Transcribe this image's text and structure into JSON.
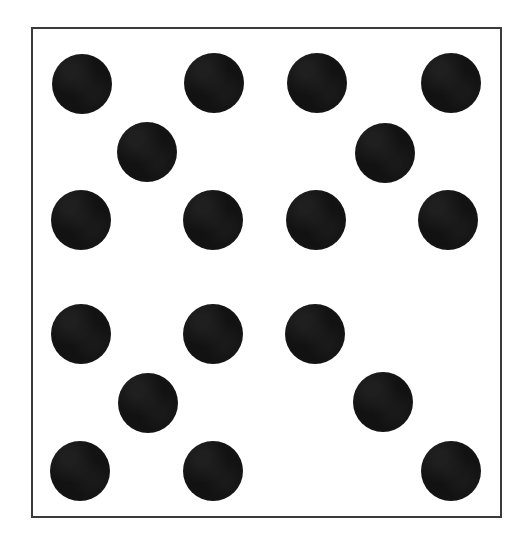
{
  "figure": {
    "title": "Scattered Dot Pattern",
    "canvas": {
      "width": 523,
      "height": 556,
      "background": "#ffffff"
    },
    "frame": {
      "name": "rectangular-border",
      "x": 31,
      "y": 27,
      "width": 471,
      "height": 491,
      "stroke_color": "#3a3a3a",
      "stroke_width": 2,
      "fill_color": "#ffffff"
    },
    "dot_style": {
      "fill_color": "#121212",
      "shape": "circle",
      "default_radius": 30
    }
  },
  "chart_data": {
    "type": "scatter",
    "title": "Scattered Dot Pattern",
    "xlabel": "",
    "ylabel": "",
    "grid": false,
    "legend": null,
    "xlim": [
      31,
      502
    ],
    "ylim": [
      27,
      518
    ],
    "marker": "filled-circle",
    "marker_color": "#121212",
    "count": 19,
    "rows": [
      {
        "row": 1,
        "y": 84,
        "count": 4
      },
      {
        "row": 2,
        "y": 152,
        "count": 2
      },
      {
        "row": 3,
        "y": 220,
        "count": 4
      },
      {
        "row": 4,
        "y": 334,
        "count": 3
      },
      {
        "row": 5,
        "y": 403,
        "count": 2
      },
      {
        "row": 6,
        "y": 471,
        "count": 3
      }
    ],
    "points": [
      {
        "id": "dot-1",
        "row": 1,
        "col": 1,
        "cx": 82,
        "cy": 84,
        "r": 30
      },
      {
        "id": "dot-2",
        "row": 1,
        "col": 2,
        "cx": 214,
        "cy": 83,
        "r": 30
      },
      {
        "id": "dot-3",
        "row": 1,
        "col": 3,
        "cx": 317,
        "cy": 83,
        "r": 30
      },
      {
        "id": "dot-4",
        "row": 1,
        "col": 4,
        "cx": 451,
        "cy": 83,
        "r": 30
      },
      {
        "id": "dot-5",
        "row": 2,
        "col": 1,
        "cx": 147,
        "cy": 152,
        "r": 30
      },
      {
        "id": "dot-6",
        "row": 2,
        "col": 2,
        "cx": 385,
        "cy": 153,
        "r": 30
      },
      {
        "id": "dot-7",
        "row": 3,
        "col": 1,
        "cx": 81,
        "cy": 220,
        "r": 30
      },
      {
        "id": "dot-8",
        "row": 3,
        "col": 2,
        "cx": 213,
        "cy": 220,
        "r": 30
      },
      {
        "id": "dot-9",
        "row": 3,
        "col": 3,
        "cx": 316,
        "cy": 220,
        "r": 30
      },
      {
        "id": "dot-10",
        "row": 3,
        "col": 4,
        "cx": 448,
        "cy": 220,
        "r": 30
      },
      {
        "id": "dot-11",
        "row": 4,
        "col": 1,
        "cx": 81,
        "cy": 334,
        "r": 30
      },
      {
        "id": "dot-12",
        "row": 4,
        "col": 2,
        "cx": 213,
        "cy": 334,
        "r": 30
      },
      {
        "id": "dot-13",
        "row": 4,
        "col": 3,
        "cx": 315,
        "cy": 334,
        "r": 30
      },
      {
        "id": "dot-14",
        "row": 5,
        "col": 1,
        "cx": 148,
        "cy": 403,
        "r": 30
      },
      {
        "id": "dot-15",
        "row": 5,
        "col": 2,
        "cx": 383,
        "cy": 402,
        "r": 30
      },
      {
        "id": "dot-16",
        "row": 6,
        "col": 1,
        "cx": 80,
        "cy": 471,
        "r": 30
      },
      {
        "id": "dot-17",
        "row": 6,
        "col": 2,
        "cx": 213,
        "cy": 471,
        "r": 30
      },
      {
        "id": "dot-18",
        "row": 6,
        "col": 3,
        "cx": 451,
        "cy": 471,
        "r": 30
      }
    ]
  }
}
